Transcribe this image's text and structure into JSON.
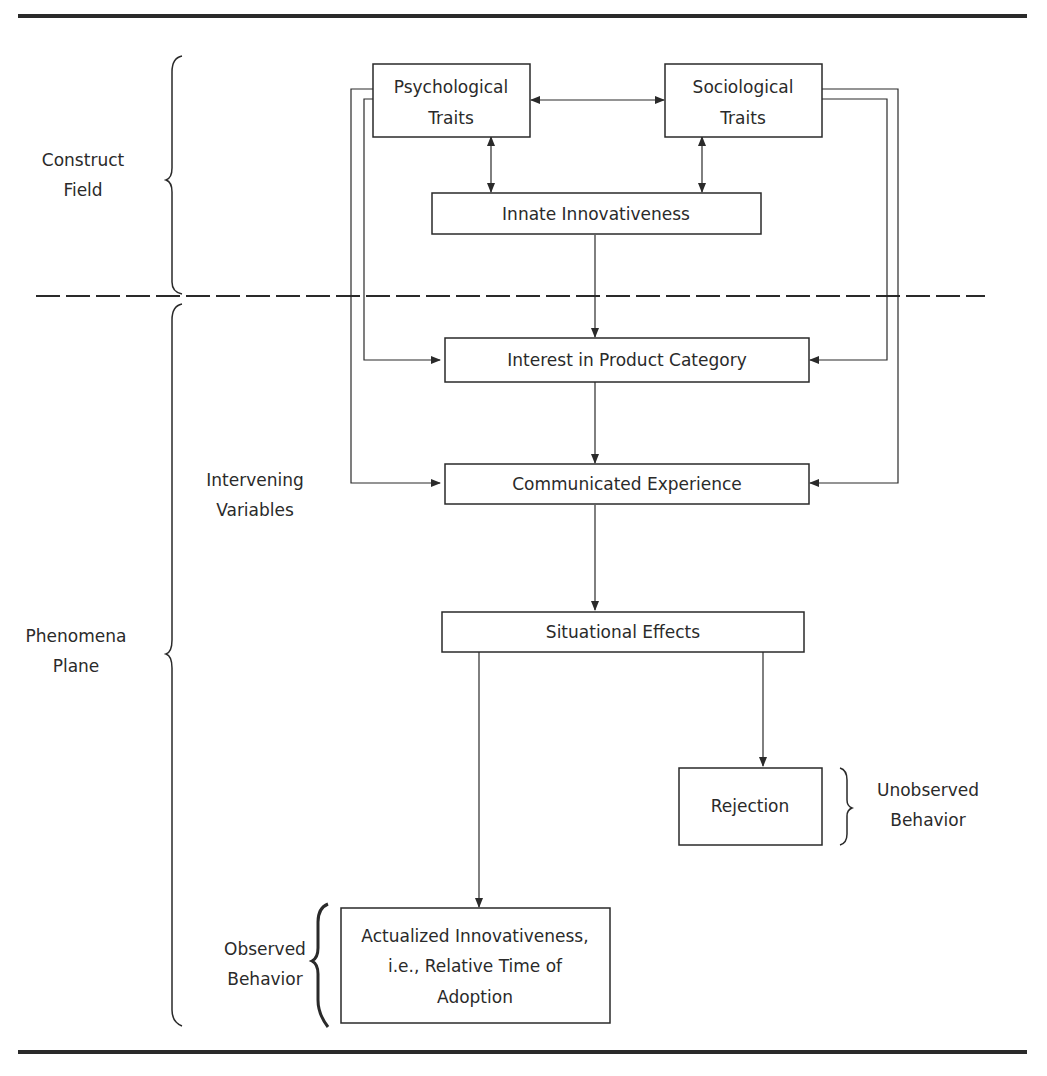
{
  "boxes": {
    "psychological": {
      "line1": "Psychological",
      "line2": "Traits"
    },
    "sociological": {
      "line1": "Sociological",
      "line2": "Traits"
    },
    "innate": {
      "label": "Innate Innovativeness"
    },
    "interest": {
      "label": "Interest in Product Category"
    },
    "communicated": {
      "label": "Communicated Experience"
    },
    "situational": {
      "label": "Situational Effects"
    },
    "rejection": {
      "label": "Rejection"
    },
    "actualized": {
      "line1": "Actualized Innovativeness,",
      "line2": "i.e., Relative Time of",
      "line3": "Adoption"
    }
  },
  "side_labels": {
    "construct_field": {
      "line1": "Construct",
      "line2": "Field"
    },
    "intervening": {
      "line1": "Intervening",
      "line2": "Variables"
    },
    "phenomena_plane": {
      "line1": "Phenomena",
      "line2": "Plane"
    },
    "unobserved": {
      "line1": "Unobserved",
      "line2": "Behavior"
    },
    "observed": {
      "line1": "Observed",
      "line2": "Behavior"
    }
  },
  "colors": {
    "ink": "#2a2a2a",
    "background": "#ffffff"
  }
}
